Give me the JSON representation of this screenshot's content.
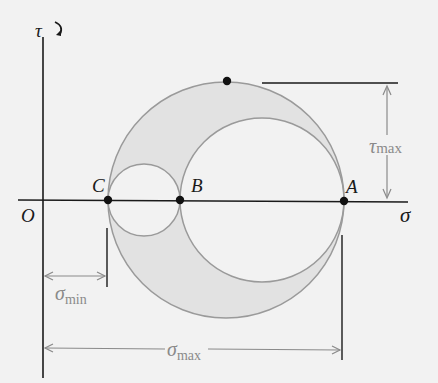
{
  "diagram": {
    "axes": {
      "vertical_label": "τ",
      "horizontal_label": "σ",
      "origin_label": "O"
    },
    "points": [
      {
        "label": "C",
        "x": 108,
        "y": 200
      },
      {
        "label": "B",
        "x": 180,
        "y": 200
      },
      {
        "label": "A",
        "x": 344,
        "y": 200
      },
      {
        "label": "",
        "x": 227,
        "y": 82
      }
    ],
    "circles": [
      {
        "name": "large-circle-CA",
        "cx": 226,
        "cy": 200,
        "r": 118
      },
      {
        "name": "small-circle-CB",
        "cx": 144,
        "cy": 200,
        "r": 36
      },
      {
        "name": "medium-circle-BA",
        "cx": 262,
        "cy": 200,
        "r": 82
      }
    ],
    "dimensions": {
      "tau_max": {
        "symbol": "τ",
        "sub": "max"
      },
      "sigma_min": {
        "symbol": "σ",
        "sub": "min"
      },
      "sigma_max": {
        "symbol": "σ",
        "sub": "max"
      }
    },
    "colors": {
      "background": "#f2f2f2",
      "shade": "#e2e2e2",
      "circle_stroke": "#9a9a9a",
      "axis": "#1a1a1a",
      "dimension": "#8a8a8a"
    }
  }
}
